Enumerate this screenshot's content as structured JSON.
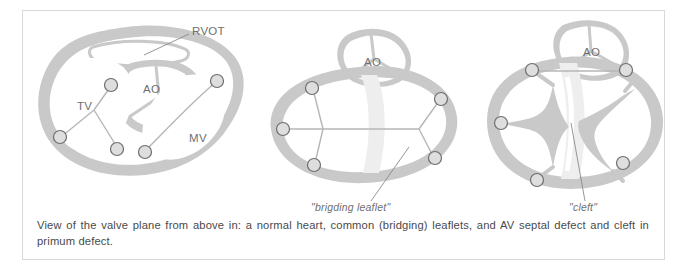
{
  "figure": {
    "caption": "View of the valve plane from above in: a normal heart, common (bridging) leaflets, and AV septal defect and cleft in primum defect.",
    "colors": {
      "tissue": "#c9c9c9",
      "tissue_light": "#d8d8d8",
      "leaflet_line": "#b0b0b0",
      "marker_stroke": "#6e6e6e",
      "marker_fill": "#e0e0e0",
      "label_text": "#6f6f6f",
      "caption_text": "#4a4a4a",
      "frame_border": "#d9d9d9",
      "background": "#ffffff",
      "septal_shadow": "#eaeaea"
    }
  },
  "panels": [
    {
      "id": "normal-heart",
      "title": "normal heart",
      "labels": [
        {
          "name": "rvot-label",
          "text": "RVOT",
          "x": 167,
          "y": 25
        },
        {
          "name": "ao-label",
          "text": "AO",
          "x": 117,
          "y": 80
        },
        {
          "name": "tv-label",
          "text": "TV",
          "x": 47,
          "y": 102
        },
        {
          "name": "mv-label",
          "text": "MV",
          "x": 165,
          "y": 132
        }
      ],
      "markers": 5,
      "callout": null
    },
    {
      "id": "common-bridging-leaflets",
      "title": "common (bridging) leaflets",
      "labels": [
        {
          "name": "ao-label",
          "text": "AO",
          "x": 105,
          "y": 52
        }
      ],
      "markers": 5,
      "callout": {
        "name": "bridging-leaflet-callout",
        "text": "\"brigding leaflet\"",
        "x": 57,
        "y": 198
      }
    },
    {
      "id": "av-septal-defect-cleft",
      "title": "AV septal defect and cleft in primum defect",
      "labels": [
        {
          "name": "ao-label",
          "text": "AO",
          "x": 110,
          "y": 42
        }
      ],
      "markers": 6,
      "callout": {
        "name": "cleft-callout",
        "text": "\"cleft\"",
        "x": 68,
        "y": 198
      }
    }
  ]
}
